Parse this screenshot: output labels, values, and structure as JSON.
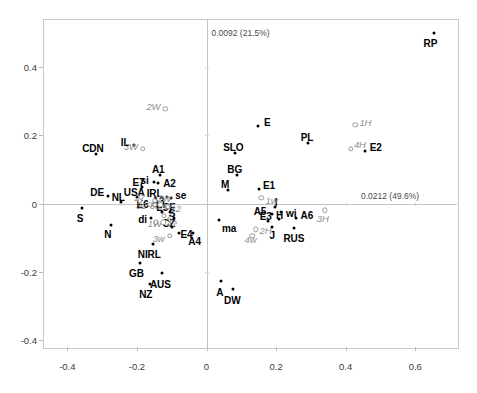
{
  "chart_data": {
    "type": "scatter",
    "title": "",
    "subtitle": "",
    "xlabel": "0.0212 (49.6%)",
    "ylabel": "0.0092 (21.5%)",
    "xlim": [
      -0.47,
      0.72
    ],
    "ylim": [
      -0.42,
      0.54
    ],
    "xticks": [
      "-0.4",
      "-0.2",
      "0",
      "0.2",
      "0.4",
      "0.6"
    ],
    "xtickvalues": [
      -0.4,
      -0.2,
      0,
      0.2,
      0.4,
      0.6
    ],
    "yticks": [
      "0.4",
      "0.2",
      "0",
      "-0.2",
      "-0.4"
    ],
    "ytickvalues": [
      0.4,
      0.2,
      0,
      -0.2,
      -0.4
    ],
    "grid": false,
    "legend": "none",
    "series": [
      {
        "name": "countries",
        "marker": "filled-dot",
        "label_style": "bold-upright-black",
        "points": [
          {
            "label": "RP",
            "x": 0.655,
            "y": 0.5,
            "lx": -4,
            "ly": 11,
            "align": "center"
          },
          {
            "label": "E",
            "x": 0.148,
            "y": 0.228,
            "lx": 6,
            "ly": -3,
            "align": "left"
          },
          {
            "label": "PL",
            "x": 0.292,
            "y": 0.176,
            "lx": -1,
            "ly": -5,
            "align": "center"
          },
          {
            "label": "E2",
            "x": 0.455,
            "y": 0.153,
            "lx": 5,
            "ly": -3,
            "align": "left"
          },
          {
            "label": "SLO",
            "x": 0.083,
            "y": 0.148,
            "lx": -2,
            "ly": -5,
            "align": "center"
          },
          {
            "label": "IL",
            "x": -0.207,
            "y": 0.17,
            "lx": -5,
            "ly": -2,
            "align": "right"
          },
          {
            "label": "CDN",
            "x": -0.318,
            "y": 0.145,
            "lx": -3,
            "ly": -5,
            "align": "center"
          },
          {
            "label": "BG",
            "x": 0.087,
            "y": 0.082,
            "lx": -2,
            "ly": -5,
            "align": "center"
          },
          {
            "label": "A1",
            "x": -0.133,
            "y": 0.084,
            "lx": -2,
            "ly": -5,
            "align": "center"
          },
          {
            "label": "A2",
            "x": -0.139,
            "y": 0.059,
            "lx": 5,
            "ly": 1,
            "align": "left"
          },
          {
            "label": "si",
            "x": -0.152,
            "y": 0.062,
            "lx": -5,
            "ly": -1,
            "align": "right"
          },
          {
            "label": "E7",
            "x": -0.184,
            "y": 0.048,
            "lx": -4,
            "ly": -4,
            "align": "center"
          },
          {
            "label": "M",
            "x": 0.062,
            "y": 0.04,
            "lx": -3,
            "ly": -5,
            "align": "center"
          },
          {
            "label": "E1",
            "x": 0.151,
            "y": 0.042,
            "lx": 4,
            "ly": -3,
            "align": "left"
          },
          {
            "label": "DE",
            "x": -0.283,
            "y": 0.022,
            "lx": -4,
            "ly": -3,
            "align": "right"
          },
          {
            "label": "USA",
            "x": -0.199,
            "y": 0.018,
            "lx": -3,
            "ly": -4,
            "align": "center"
          },
          {
            "label": "IRL",
            "x": -0.115,
            "y": 0.018,
            "lx": -4,
            "ly": -3,
            "align": "right"
          },
          {
            "label": "se",
            "x": -0.101,
            "y": 0.016,
            "lx": 4,
            "ly": -2,
            "align": "left"
          },
          {
            "label": "NL",
            "x": -0.245,
            "y": 0.005,
            "lx": -3,
            "ly": -4,
            "align": "center"
          },
          {
            "label": "E6",
            "x": -0.152,
            "y": -0.002,
            "lx": -5,
            "ly": 1,
            "align": "right"
          },
          {
            "label": "A3",
            "x": -0.142,
            "y": -0.006,
            "lx": 1,
            "ly": -4,
            "align": "center"
          },
          {
            "label": "I",
            "x": 0.197,
            "y": -0.01,
            "lx": 1,
            "ly": -4,
            "align": "center"
          },
          {
            "label": "S",
            "x": -0.358,
            "y": -0.012,
            "lx": -2,
            "ly": 11,
            "align": "center"
          },
          {
            "label": "E5",
            "x": -0.127,
            "y": -0.026,
            "lx": 0,
            "ly": -4,
            "align": "center"
          },
          {
            "label": "F",
            "x": -0.104,
            "y": -0.025,
            "lx": 2,
            "ly": -4,
            "align": "center"
          },
          {
            "label": "wi",
            "x": 0.214,
            "y": -0.026,
            "lx": 5,
            "ly": 2,
            "align": "left"
          },
          {
            "label": "A5",
            "x": 0.189,
            "y": -0.031,
            "lx": -6,
            "ly": -2,
            "align": "right"
          },
          {
            "label": "S",
            "x": -0.093,
            "y": -0.043,
            "lx": -2,
            "ly": -4,
            "align": "center"
          },
          {
            "label": "di",
            "x": -0.16,
            "y": -0.042,
            "lx": -4,
            "ly": 2,
            "align": "right"
          },
          {
            "label": "H",
            "x": 0.207,
            "y": -0.046,
            "lx": 1,
            "ly": -3,
            "align": "center"
          },
          {
            "label": "A6",
            "x": 0.256,
            "y": -0.041,
            "lx": 5,
            "ly": -2,
            "align": "left"
          },
          {
            "label": "ma",
            "x": 0.036,
            "y": -0.048,
            "lx": 3,
            "ly": 9,
            "align": "left"
          },
          {
            "label": "E3",
            "x": 0.176,
            "y": -0.052,
            "lx": -2,
            "ly": -4,
            "align": "center"
          },
          {
            "label": "N",
            "x": -0.275,
            "y": -0.062,
            "lx": -3,
            "ly": 10,
            "align": "center"
          },
          {
            "label": "CZ",
            "x": -0.1,
            "y": -0.069,
            "lx": -3,
            "ly": -3,
            "align": "center"
          },
          {
            "label": "J",
            "x": 0.189,
            "y": -0.069,
            "lx": 0,
            "ly": 9,
            "align": "center"
          },
          {
            "label": "RUS",
            "x": 0.251,
            "y": -0.072,
            "lx": 0,
            "ly": 11,
            "align": "center"
          },
          {
            "label": "E4",
            "x": -0.078,
            "y": -0.086,
            "lx": 1,
            "ly": 2,
            "align": "left"
          },
          {
            "label": "A4",
            "x": -0.04,
            "y": -0.086,
            "lx": 2,
            "ly": 9,
            "align": "center"
          },
          {
            "label": "NIRL",
            "x": -0.153,
            "y": -0.119,
            "lx": -4,
            "ly": 11,
            "align": "center"
          },
          {
            "label": "GB",
            "x": -0.19,
            "y": -0.175,
            "lx": -4,
            "ly": 11,
            "align": "center"
          },
          {
            "label": "AUS",
            "x": -0.127,
            "y": -0.203,
            "lx": -2,
            "ly": 12,
            "align": "center"
          },
          {
            "label": "A",
            "x": 0.041,
            "y": -0.228,
            "lx": -1,
            "ly": 12,
            "align": "center"
          },
          {
            "label": "NZ",
            "x": -0.163,
            "y": -0.235,
            "lx": -4,
            "ly": 11,
            "align": "center"
          },
          {
            "label": "DW",
            "x": 0.077,
            "y": -0.25,
            "lx": -1,
            "ly": 12,
            "align": "center"
          }
        ]
      },
      {
        "name": "categories",
        "marker": "open-circle",
        "label_style": "italic-gray",
        "points": [
          {
            "label": "2W",
            "x": -0.118,
            "y": 0.277,
            "lx": -5,
            "ly": -2,
            "align": "right"
          },
          {
            "label": "1H",
            "x": 0.428,
            "y": 0.23,
            "lx": 4,
            "ly": -2,
            "align": "left"
          },
          {
            "label": "4H",
            "x": 0.415,
            "y": 0.16,
            "lx": 3,
            "ly": -4,
            "align": "left"
          },
          {
            "label": "3W",
            "x": -0.183,
            "y": 0.16,
            "lx": -5,
            "ly": -2,
            "align": "right"
          },
          {
            "label": "27",
            "x": -0.192,
            "y": 0.008,
            "lx": 0,
            "ly": -3,
            "align": "center"
          },
          {
            "label": "2W",
            "x": -0.148,
            "y": 0.008,
            "lx": 2,
            "ly": -2,
            "align": "left"
          },
          {
            "label": "1w",
            "x": 0.158,
            "y": 0.016,
            "lx": 4,
            "ly": 3,
            "align": "left"
          },
          {
            "label": "32",
            "x": -0.162,
            "y": -0.004,
            "lx": -4,
            "ly": 1,
            "align": "right"
          },
          {
            "label": "6d",
            "x": -0.148,
            "y": -0.004,
            "lx": 0,
            "ly": 1,
            "align": "center"
          },
          {
            "label": "W",
            "x": -0.133,
            "y": -0.004,
            "lx": 3,
            "ly": 1,
            "align": "left"
          },
          {
            "label": "12",
            "x": -0.112,
            "y": -0.01,
            "lx": 3,
            "ly": 2,
            "align": "left"
          },
          {
            "label": "3H",
            "x": 0.34,
            "y": -0.02,
            "lx": -2,
            "ly": 9,
            "align": "center"
          },
          {
            "label": "6",
            "x": -0.123,
            "y": -0.036,
            "lx": 3,
            "ly": 3,
            "align": "left"
          },
          {
            "label": "1W",
            "x": -0.146,
            "y": -0.055,
            "lx": -1,
            "ly": 2,
            "align": "center"
          },
          {
            "label": "4?",
            "x": -0.124,
            "y": -0.055,
            "lx": 3,
            "ly": 2,
            "align": "left"
          },
          {
            "label": "2H",
            "x": 0.141,
            "y": -0.075,
            "lx": 4,
            "ly": 2,
            "align": "left"
          },
          {
            "label": "3w",
            "x": -0.106,
            "y": -0.095,
            "lx": -5,
            "ly": 3,
            "align": "right"
          },
          {
            "label": "4w",
            "x": 0.132,
            "y": -0.094,
            "lx": -2,
            "ly": 4,
            "align": "center"
          }
        ]
      }
    ]
  }
}
